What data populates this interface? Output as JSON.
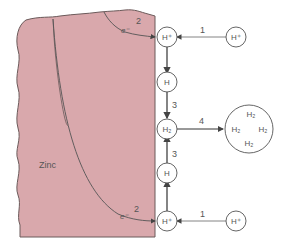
{
  "diagram": {
    "metal_label": "Zinc",
    "colors": {
      "metal_fill": "#d9a8ac",
      "metal_stroke": "#6b5a5a",
      "line": "#444444",
      "text": "#555555"
    },
    "steps": {
      "step1": "1",
      "step2": "2",
      "step3": "3",
      "step4": "4"
    },
    "electron": "e⁻",
    "species": {
      "h_plus": "H⁺",
      "h_atom": "H",
      "h2": "H₂"
    },
    "bubble": [
      "H₂",
      "H₂",
      "H₂",
      "H₂"
    ]
  }
}
